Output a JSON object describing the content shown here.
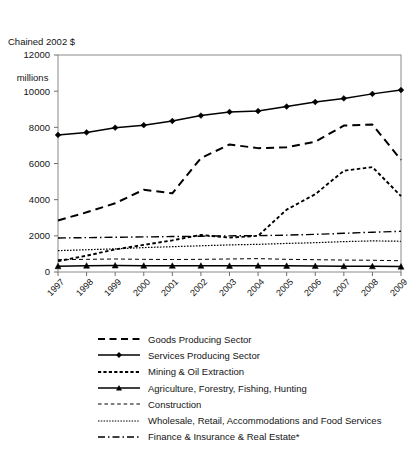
{
  "axis_caption": {
    "line1": "Chained 2002 $",
    "line2": "millions"
  },
  "chart_data": {
    "type": "line",
    "title": "",
    "subtitle": "",
    "xlabel": "",
    "ylabel": "Chained 2002 $ millions",
    "ylim": [
      0,
      12000
    ],
    "ytick_labels": [
      "0",
      "2000",
      "4000",
      "6000",
      "8000",
      "10000",
      "12000"
    ],
    "yticks": [
      0,
      2000,
      4000,
      6000,
      8000,
      10000,
      12000
    ],
    "grid": false,
    "legend_position": "bottom",
    "categories": [
      "1997",
      "1998",
      "1999",
      "2000",
      "2001",
      "2002",
      "2003",
      "2004",
      "2005",
      "2006",
      "2007",
      "2008",
      "2009"
    ],
    "x": [
      1997,
      1998,
      1999,
      2000,
      2001,
      2002,
      2003,
      2004,
      2005,
      2006,
      2007,
      2008,
      2009
    ],
    "series": [
      {
        "name": "Goods Producing Sector",
        "style": "dashed",
        "marker": "none",
        "color": "#000000",
        "values": [
          2850,
          3300,
          3800,
          4550,
          4350,
          6300,
          7050,
          6850,
          6900,
          7200,
          8100,
          8150,
          6200
        ]
      },
      {
        "name": "Services Producing Sector",
        "style": "solid",
        "marker": "diamond",
        "color": "#000000",
        "values": [
          7580,
          7720,
          7980,
          8120,
          8350,
          8650,
          8850,
          8900,
          9150,
          9400,
          9600,
          9850,
          10060
        ]
      },
      {
        "name": "Mining & Oil Extraction",
        "style": "dotted",
        "marker": "none",
        "color": "#000000",
        "values": [
          600,
          900,
          1250,
          1500,
          1750,
          2050,
          1900,
          2000,
          3450,
          4300,
          5600,
          5800,
          4200
        ]
      },
      {
        "name": "Agriculture, Forestry, Fishing, Hunting",
        "style": "solid",
        "marker": "triangle",
        "color": "#000000",
        "values": [
          320,
          350,
          360,
          350,
          345,
          345,
          340,
          350,
          340,
          330,
          320,
          315,
          300
        ]
      },
      {
        "name": "Construction",
        "style": "dashed-fine",
        "marker": "none",
        "color": "#000000",
        "values": [
          680,
          700,
          720,
          700,
          690,
          700,
          720,
          740,
          700,
          680,
          660,
          650,
          620
        ]
      },
      {
        "name": "Wholesale, Retail, Accommodations and Food Services",
        "style": "dotted-fine",
        "marker": "none",
        "color": "#000000",
        "values": [
          1180,
          1230,
          1280,
          1350,
          1400,
          1450,
          1500,
          1530,
          1580,
          1620,
          1680,
          1720,
          1700
        ]
      },
      {
        "name": "Finance & Insurance & Real Estate*",
        "style": "dash-dot",
        "marker": "none",
        "color": "#000000",
        "values": [
          1880,
          1900,
          1920,
          1940,
          1960,
          1980,
          2000,
          2010,
          2040,
          2080,
          2140,
          2200,
          2250
        ]
      }
    ]
  },
  "legend": {
    "items": [
      {
        "label": "Goods Producing Sector",
        "key": "dashed"
      },
      {
        "label": "Services Producing Sector",
        "key": "solid-diamond"
      },
      {
        "label": "Mining & Oil Extraction",
        "key": "dotted"
      },
      {
        "label": "Agriculture, Forestry, Fishing, Hunting",
        "key": "solid-triangle"
      },
      {
        "label": "Construction",
        "key": "dashed-fine"
      },
      {
        "label": "Wholesale, Retail, Accommodations and Food Services",
        "key": "dotted-fine"
      },
      {
        "label": "Finance & Insurance & Real Estate*",
        "key": "dash-dot"
      }
    ]
  }
}
